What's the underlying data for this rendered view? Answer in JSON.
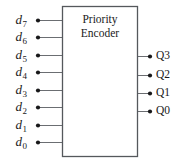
{
  "diagram": {
    "type": "logic-block-diagram",
    "title": "Priority Encoder",
    "title_line1": "Priority",
    "title_line2": "Encoder",
    "colors": {
      "background": "#ffffff",
      "outline": "#55585c",
      "wire": "#6b6e72",
      "node": "#18181a",
      "text": "#1a1a1a"
    },
    "block": {
      "label": "Priority Encoder",
      "x": 62,
      "y": 6,
      "width": 76,
      "height": 151
    },
    "inputs": [
      {
        "name": "d7",
        "base": "d",
        "sub": "7",
        "y": 20
      },
      {
        "name": "d6",
        "base": "d",
        "sub": "6",
        "y": 37
      },
      {
        "name": "d5",
        "base": "d",
        "sub": "5",
        "y": 55
      },
      {
        "name": "d4",
        "base": "d",
        "sub": "4",
        "y": 72
      },
      {
        "name": "d3",
        "base": "d",
        "sub": "3",
        "y": 90
      },
      {
        "name": "d2",
        "base": "d",
        "sub": "2",
        "y": 107
      },
      {
        "name": "d1",
        "base": "d",
        "sub": "1",
        "y": 125
      },
      {
        "name": "d0",
        "base": "d",
        "sub": "0",
        "y": 142
      }
    ],
    "outputs": [
      {
        "name": "Q3",
        "label": "Q3",
        "y": 56
      },
      {
        "name": "Q2",
        "label": "Q2",
        "y": 75
      },
      {
        "name": "Q1",
        "label": "Q1",
        "y": 93
      },
      {
        "name": "Q0",
        "label": "Q0",
        "y": 111
      }
    ],
    "geometry": {
      "input_dot_x": 38,
      "input_wire_end_x": 62,
      "output_wire_start_x": 138,
      "output_dot_x": 150,
      "dot_radius": 2.1,
      "wire_width": 1.1,
      "outline_width": 1.3
    }
  }
}
